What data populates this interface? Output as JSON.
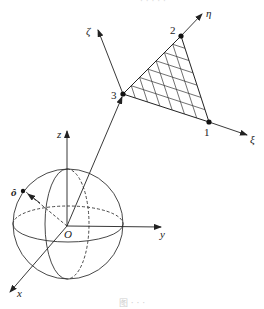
{
  "figure": {
    "header_fragment": "· · · · ·",
    "caption": "图 · · ·",
    "labels": {
      "zeta": "ζ",
      "eta": "η",
      "xi": "ξ",
      "node1": "1",
      "node2": "2",
      "node3": "3",
      "z": "z",
      "y": "y",
      "x": "x",
      "origin": "O",
      "unit_vector": "ô"
    },
    "colors": {
      "line": "#333333",
      "dash": "#555555",
      "background": "#ffffff"
    },
    "geometry": {
      "sphere": {
        "cx": 68,
        "cy": 224,
        "r": 55
      },
      "origin": [
        67,
        226
      ],
      "z_axis_tip": [
        67,
        130
      ],
      "y_axis_tip": [
        162,
        227
      ],
      "x_axis_tip": [
        9,
        293
      ],
      "node1": [
        209,
        122
      ],
      "node2": [
        181,
        36
      ],
      "node3": [
        123,
        94
      ],
      "zeta_tip": [
        97,
        28
      ],
      "eta_tip": [
        203,
        13
      ],
      "xi_tip": [
        248,
        135
      ],
      "grid_divisions": 7
    }
  }
}
